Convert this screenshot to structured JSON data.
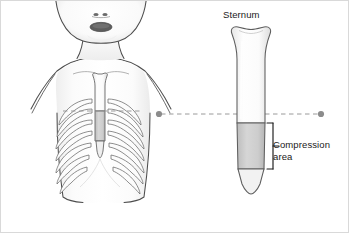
{
  "figure": {
    "labels": {
      "sternum": "Sternum",
      "compression_area": "Compression\narea"
    },
    "colors": {
      "outline": "#4d4d4d",
      "bone_outline": "#555555",
      "bone_fill": "#fdfdfd",
      "compression_fill": "#c9c9c9",
      "shade": "#ededed",
      "dashed_line": "#9a9a9a",
      "dot": "#8c8c8c",
      "bracket": "#1a1a1a",
      "text": "#1a1a1a",
      "mouth": "#5a5a5a",
      "background": "#ffffff",
      "border": "#d9d9d9"
    },
    "panels": {
      "torso": {
        "name": "Anterior torso with ribcage",
        "rib_pairs": 7,
        "features": [
          "head tilted back",
          "open mouth",
          "nostrils",
          "neck",
          "shoulders",
          "clavicles",
          "sternum",
          "xiphoid process",
          "ribcage",
          "waist"
        ]
      },
      "sternum_detail": {
        "name": "Isolated sternum, enlarged",
        "segments": [
          "manubrium",
          "body",
          "compression area",
          "xiphoid process"
        ]
      }
    },
    "connector": {
      "name": "landmark alignment line",
      "style": "dashed",
      "endpoint_markers": 2
    },
    "bracket": {
      "name": "compression area bracket",
      "spans": "compression area"
    }
  }
}
